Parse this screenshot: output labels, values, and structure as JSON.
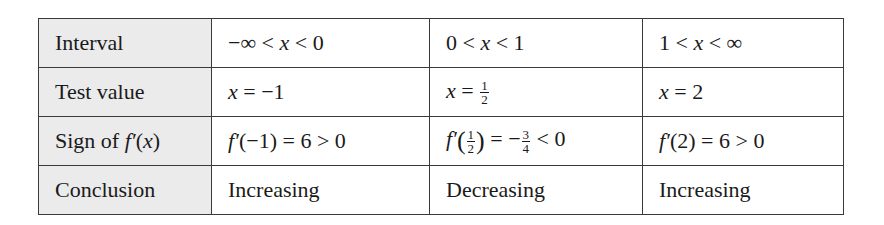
{
  "table": {
    "headers": [
      "Interval",
      "Test value",
      "Sign of f′(x)",
      "Conclusion"
    ],
    "rows": {
      "interval": [
        "−∞ < x < 0",
        "0 < x < 1",
        "1 < x < ∞"
      ],
      "test_value": [
        "x = −1",
        "x = 1/2",
        "x = 2"
      ],
      "sign": [
        "f′(−1) = 6 > 0",
        "f′(1/2) = −3/4 < 0",
        "f′(2) = 6 > 0"
      ],
      "conclusion": [
        "Increasing",
        "Decreasing",
        "Increasing"
      ]
    },
    "parts": {
      "interval_1": {
        "a": "−∞ < ",
        "x": "x",
        "b": " < 0"
      },
      "interval_2": {
        "a": "0 < ",
        "x": "x",
        "b": " < 1"
      },
      "interval_3": {
        "a": "1 < ",
        "x": "x",
        "b": " < ∞"
      },
      "tv_1": {
        "x": "x",
        "rest": " = −1"
      },
      "tv_2": {
        "x": "x",
        "rest": " = ",
        "num": "1",
        "den": "2"
      },
      "tv_3": {
        "x": "x",
        "rest": " = 2"
      },
      "sign_label": {
        "pre": "Sign of ",
        "f": "f′",
        "open": "(",
        "x": "x",
        "close": ")"
      },
      "sign_1": {
        "f": "f′",
        "rest": "(−1) = 6 > 0"
      },
      "sign_2": {
        "f": "f′",
        "lp": "(",
        "num": "1",
        "den": "2",
        "rp": ")",
        "mid": " = −",
        "num2": "3",
        "den2": "4",
        "end": " < 0"
      },
      "sign_3": {
        "f": "f′",
        "rest": "(2) = 6 > 0"
      }
    }
  },
  "colors": {
    "header_bg": "#ebebeb",
    "border": "#3a3a3a",
    "text": "#1a1a1a"
  }
}
